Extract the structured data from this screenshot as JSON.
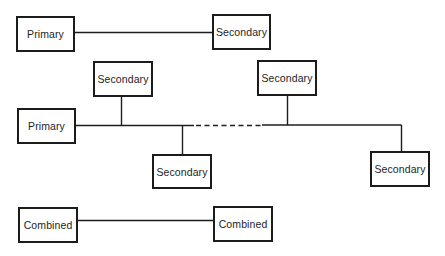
{
  "diagram": {
    "type": "network-topology-comparison",
    "rows": [
      {
        "name": "point-to-point",
        "nodes": [
          {
            "id": "r1-primary",
            "label": "Primary"
          },
          {
            "id": "r1-secondary",
            "label": "Secondary"
          }
        ],
        "edges": [
          {
            "from": "r1-primary",
            "to": "r1-secondary",
            "style": "solid"
          }
        ]
      },
      {
        "name": "multipoint",
        "nodes": [
          {
            "id": "r2-primary",
            "label": "Primary"
          },
          {
            "id": "r2-secondary-1",
            "label": "Secondary"
          },
          {
            "id": "r2-secondary-2",
            "label": "Secondary"
          },
          {
            "id": "r2-secondary-3",
            "label": "Secondary"
          },
          {
            "id": "r2-secondary-4",
            "label": "Secondary"
          }
        ],
        "edges": [
          {
            "from": "r2-primary",
            "to": "r2-secondary-1",
            "style": "solid",
            "via": "bus"
          },
          {
            "from": "r2-primary",
            "to": "r2-secondary-2",
            "style": "solid",
            "via": "bus"
          },
          {
            "from": "r2-secondary-2",
            "to": "r2-secondary-3",
            "style": "dashed",
            "via": "bus"
          },
          {
            "from": "r2-primary",
            "to": "r2-secondary-3",
            "style": "solid",
            "via": "bus"
          },
          {
            "from": "r2-primary",
            "to": "r2-secondary-4",
            "style": "solid",
            "via": "bus"
          }
        ]
      },
      {
        "name": "balanced",
        "nodes": [
          {
            "id": "r3-combined-1",
            "label": "Combined"
          },
          {
            "id": "r3-combined-2",
            "label": "Combined"
          }
        ],
        "edges": [
          {
            "from": "r3-combined-1",
            "to": "r3-combined-2",
            "style": "solid"
          }
        ]
      }
    ]
  },
  "labels": {
    "row1": {
      "left": "Primary",
      "right": "Secondary"
    },
    "row2": {
      "primary": "Primary",
      "secondary_top_left": "Secondary",
      "secondary_bottom_left": "Secondary",
      "secondary_top_right": "Secondary",
      "secondary_bottom_right": "Secondary"
    },
    "row3": {
      "left": "Combined",
      "right": "Combined"
    }
  },
  "colors": {
    "stroke": "#1c1c1c",
    "background": "#ffffff",
    "text": "#1e1e1e"
  }
}
